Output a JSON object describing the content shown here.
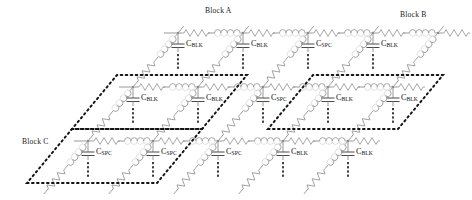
{
  "figure": {
    "type": "circuit-schematic",
    "projection": "oblique",
    "width": 472,
    "height": 200,
    "background": "#ffffff"
  },
  "colors": {
    "wire": "#8c8c8c",
    "component": "#9a9a9a",
    "dashed_block": "#141414",
    "text": "#141414",
    "capacitor_plate": "#4a4a4a"
  },
  "blocks": [
    {
      "id": "A",
      "label": "Block A",
      "label_x": 205,
      "label_y": 8,
      "origin_x": 72,
      "origin_y": 129,
      "cell_w": 130,
      "cell_h": 54,
      "skew": 45
    },
    {
      "id": "B",
      "label": "Block B",
      "label_x": 400,
      "label_y": 8,
      "origin_x": 268,
      "origin_y": 129,
      "cell_w": 130,
      "cell_h": 54,
      "skew": 45
    },
    {
      "id": "C",
      "label": "Block C",
      "label_x": 22,
      "label_y": 139,
      "origin_x": 27,
      "origin_y": 183,
      "cell_w": 130,
      "cell_h": 54,
      "skew": 45
    }
  ],
  "rows": [
    {
      "index": 0,
      "wire_y": 33,
      "x_start": 178,
      "node_spacing": 65,
      "node_count": 5,
      "first_node_x": 178
    },
    {
      "index": 1,
      "wire_y": 87,
      "x_start": 133,
      "node_spacing": 65,
      "node_count": 5,
      "first_node_x": 133
    },
    {
      "index": 2,
      "wire_y": 141,
      "x_start": 88,
      "node_spacing": 65,
      "node_count": 5,
      "first_node_x": 88
    }
  ],
  "capacitors": [
    {
      "row": 0,
      "col": 0,
      "x": 178,
      "y": 33,
      "label": "C",
      "sub": "BLK"
    },
    {
      "row": 0,
      "col": 1,
      "x": 243,
      "y": 33,
      "label": "C",
      "sub": "BLK"
    },
    {
      "row": 0,
      "col": 2,
      "x": 308,
      "y": 33,
      "label": "C",
      "sub": "SPC"
    },
    {
      "row": 0,
      "col": 3,
      "x": 373,
      "y": 33,
      "label": "C",
      "sub": "BLK"
    },
    {
      "row": 1,
      "col": 0,
      "x": 133,
      "y": 87,
      "label": "C",
      "sub": "BLK"
    },
    {
      "row": 1,
      "col": 1,
      "x": 198,
      "y": 87,
      "label": "C",
      "sub": "BLK"
    },
    {
      "row": 1,
      "col": 2,
      "x": 263,
      "y": 87,
      "label": "C",
      "sub": "SPC"
    },
    {
      "row": 1,
      "col": 3,
      "x": 328,
      "y": 87,
      "label": "C",
      "sub": "BLK"
    },
    {
      "row": 1,
      "col": 4,
      "x": 393,
      "y": 87,
      "label": "C",
      "sub": "BLK"
    },
    {
      "row": 2,
      "col": 0,
      "x": 88,
      "y": 141,
      "label": "C",
      "sub": "SPC"
    },
    {
      "row": 2,
      "col": 1,
      "x": 153,
      "y": 141,
      "label": "C",
      "sub": "SPC"
    },
    {
      "row": 2,
      "col": 2,
      "x": 218,
      "y": 141,
      "label": "C",
      "sub": "SPC"
    },
    {
      "row": 2,
      "col": 3,
      "x": 283,
      "y": 141,
      "label": "C",
      "sub": "BLK"
    },
    {
      "row": 2,
      "col": 4,
      "x": 348,
      "y": 141,
      "label": "C",
      "sub": "BLK"
    }
  ],
  "components": {
    "series_resistor": "resistor-zigzag",
    "series_inductor": "inductor-coil",
    "shunt_capacitor": "capacitor-parallel-plate",
    "continuation": "vertical-ellipsis",
    "diagonal_branch": "resistor-inductor-series"
  },
  "legend_note": {
    "c_blk": "C_BLK",
    "c_spc": "C_SPC"
  }
}
